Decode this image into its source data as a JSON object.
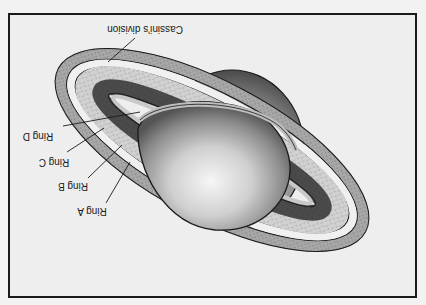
{
  "diagram": {
    "orientation": "rotated 180 degrees",
    "labels": [
      {
        "id": "cassini",
        "text": "Cassini's division"
      },
      {
        "id": "ring_d",
        "text": "Ring D"
      },
      {
        "id": "ring_c",
        "text": "Ring C"
      },
      {
        "id": "ring_b",
        "text": "Ring B"
      },
      {
        "id": "ring_a",
        "text": "Ring A"
      }
    ]
  },
  "colors": {
    "background": "#eeeeee",
    "frame": "#1a1a1a",
    "ring_outer": "#b5b5b5",
    "ring_speckled": "#d6d6d6",
    "ring_dark": "#4a4a4a",
    "planet_light": "#f4f4f4",
    "planet_dark": "#5a5a5a"
  }
}
